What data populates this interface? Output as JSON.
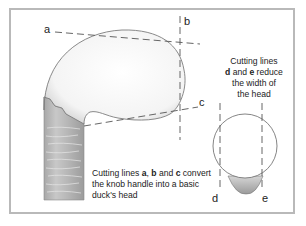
{
  "diagram": {
    "type": "woodcarving cutting guide",
    "frame_color": "#b9b9b9",
    "line_labels": {
      "a": "a",
      "b": "b",
      "c": "c",
      "d": "d",
      "e": "e"
    },
    "captions": {
      "side_view": {
        "part1": "Cutting lines ",
        "a": "a",
        "sep1": ", ",
        "b": "b",
        "sep2": " and ",
        "c": "c",
        "part2": " convert",
        "line2": "the knob handle into a basic",
        "line3": "duck's head"
      },
      "front_view": {
        "line1": "Cutting lines",
        "d": "d",
        "line2_rest": " and ",
        "e": "e",
        "line2_end": " reduce",
        "line3": "the width of",
        "line4": "the head"
      }
    },
    "elements": [
      {
        "name": "knob-handle-side-view",
        "shape": "rounded knob on a wood-grained stick"
      },
      {
        "name": "knob-front-view",
        "shape": "circle with shaded neck below"
      }
    ]
  }
}
